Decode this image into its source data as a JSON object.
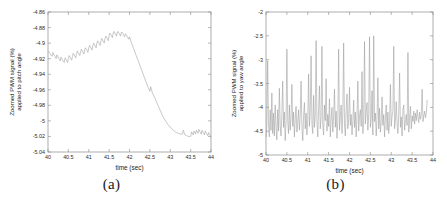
{
  "figure": {
    "background": "#ffffff",
    "line_color": "#9a9a9a",
    "axis_color": "#8a8a8a",
    "panels": [
      {
        "id": "a",
        "caption": "(a)"
      },
      {
        "id": "b",
        "caption": "(b)"
      }
    ]
  },
  "chart_data": [
    {
      "type": "line",
      "panel": "a",
      "caption": "(a)",
      "title": "",
      "xlabel": "time (sec)",
      "ylabel": "Zoomed PWM signal (%) applied to pitch angle",
      "ylabel_line1": "Zoomed PWM signal (%)",
      "ylabel_line2": "applied to pitch angle",
      "xlim": [
        40,
        44
      ],
      "ylim": [
        -5.04,
        -4.86
      ],
      "grid": false,
      "legend": "none",
      "xticks": [
        40,
        40.5,
        41,
        41.5,
        42,
        42.5,
        43,
        43.5,
        44
      ],
      "xticklabels": [
        "40",
        "40.5",
        "41",
        "41.5",
        "42",
        "42.5",
        "43",
        "43.5",
        "44"
      ],
      "yticks": [
        -5.04,
        -5.02,
        -5,
        -4.98,
        -4.96,
        -4.94,
        -4.92,
        -4.9,
        -4.88,
        -4.86
      ],
      "yticklabels": [
        "-5.04",
        "-5.02",
        "-5",
        "-4.98",
        "-4.96",
        "-4.94",
        "-4.92",
        "-4.9",
        "-4.88",
        "-4.86"
      ],
      "series": [
        {
          "name": "pitch PWM",
          "x": [
            40.0,
            40.02,
            40.04,
            40.06,
            40.08,
            40.1,
            40.12,
            40.14,
            40.16,
            40.18,
            40.2,
            40.22,
            40.24,
            40.26,
            40.28,
            40.3,
            40.32,
            40.34,
            40.36,
            40.38,
            40.4,
            40.42,
            40.44,
            40.46,
            40.48,
            40.5,
            40.52,
            40.54,
            40.56,
            40.58,
            40.6,
            40.62,
            40.64,
            40.66,
            40.68,
            40.7,
            40.72,
            40.74,
            40.76,
            40.78,
            40.8,
            40.82,
            40.84,
            40.86,
            40.88,
            40.9,
            40.92,
            40.94,
            40.96,
            40.98,
            41.0,
            41.02,
            41.04,
            41.06,
            41.08,
            41.1,
            41.12,
            41.14,
            41.16,
            41.18,
            41.2,
            41.22,
            41.24,
            41.26,
            41.28,
            41.3,
            41.32,
            41.34,
            41.36,
            41.38,
            41.4,
            41.42,
            41.44,
            41.46,
            41.48,
            41.5,
            41.52,
            41.54,
            41.56,
            41.58,
            41.6,
            41.62,
            41.64,
            41.66,
            41.68,
            41.7,
            41.72,
            41.74,
            41.76,
            41.78,
            41.8,
            41.82,
            41.84,
            41.86,
            41.88,
            41.9,
            41.92,
            41.94,
            41.96,
            41.98,
            42.0,
            42.05,
            42.1,
            42.15,
            42.2,
            42.25,
            42.3,
            42.35,
            42.4,
            42.45,
            42.5,
            42.52,
            42.54,
            42.56,
            42.6,
            42.65,
            42.7,
            42.75,
            42.8,
            42.85,
            42.9,
            42.95,
            43.0,
            43.05,
            43.1,
            43.15,
            43.2,
            43.25,
            43.3,
            43.32,
            43.34,
            43.36,
            43.4,
            43.45,
            43.5,
            43.52,
            43.54,
            43.56,
            43.58,
            43.6,
            43.62,
            43.64,
            43.66,
            43.68,
            43.7,
            43.72,
            43.74,
            43.76,
            43.78,
            43.8,
            43.82,
            43.84,
            43.86,
            43.88,
            43.9,
            43.92,
            43.94,
            43.96,
            43.98,
            44.0
          ],
          "y": [
            -4.91,
            -4.911,
            -4.913,
            -4.914,
            -4.916,
            -4.917,
            -4.912,
            -4.914,
            -4.916,
            -4.918,
            -4.92,
            -4.915,
            -4.917,
            -4.919,
            -4.921,
            -4.923,
            -4.918,
            -4.92,
            -4.922,
            -4.924,
            -4.925,
            -4.919,
            -4.921,
            -4.923,
            -4.925,
            -4.92,
            -4.916,
            -4.918,
            -4.92,
            -4.922,
            -4.917,
            -4.913,
            -4.915,
            -4.917,
            -4.919,
            -4.914,
            -4.91,
            -4.912,
            -4.914,
            -4.916,
            -4.911,
            -4.908,
            -4.91,
            -4.912,
            -4.914,
            -4.909,
            -4.906,
            -4.908,
            -4.91,
            -4.912,
            -4.906,
            -4.903,
            -4.905,
            -4.907,
            -4.909,
            -4.903,
            -4.9,
            -4.902,
            -4.904,
            -4.906,
            -4.9,
            -4.897,
            -4.899,
            -4.901,
            -4.903,
            -4.897,
            -4.894,
            -4.896,
            -4.898,
            -4.9,
            -4.894,
            -4.891,
            -4.893,
            -4.895,
            -4.897,
            -4.89,
            -4.887,
            -4.889,
            -4.891,
            -4.893,
            -4.887,
            -4.885,
            -4.887,
            -4.889,
            -4.891,
            -4.886,
            -4.885,
            -4.887,
            -4.889,
            -4.891,
            -4.886,
            -4.886,
            -4.888,
            -4.89,
            -4.892,
            -4.888,
            -4.889,
            -4.891,
            -4.893,
            -4.895,
            -4.892,
            -4.9,
            -4.907,
            -4.914,
            -4.921,
            -4.928,
            -4.935,
            -4.942,
            -4.949,
            -4.956,
            -4.962,
            -4.956,
            -4.96,
            -4.964,
            -4.968,
            -4.974,
            -4.98,
            -4.986,
            -4.992,
            -4.997,
            -5.001,
            -5.005,
            -5.008,
            -5.011,
            -5.013,
            -5.015,
            -5.016,
            -5.017,
            -5.017,
            -5.012,
            -5.015,
            -5.018,
            -5.019,
            -5.02,
            -5.02,
            -5.014,
            -5.016,
            -5.018,
            -5.013,
            -5.015,
            -5.017,
            -5.012,
            -5.014,
            -5.016,
            -5.011,
            -5.013,
            -5.015,
            -5.017,
            -5.012,
            -5.014,
            -5.016,
            -5.018,
            -5.013,
            -5.015,
            -5.017,
            -5.019,
            -5.015,
            -5.017,
            -5.019,
            -5.021,
            -5.022
          ]
        }
      ]
    },
    {
      "type": "line",
      "panel": "b",
      "caption": "(b)",
      "title": "",
      "xlabel": "time (sec)",
      "ylabel": "Zoomed PWM signal (%) applied to yaw angle",
      "ylabel_line1": "Zoomed PWM signal (%)",
      "ylabel_line2": "applied to yaw angle",
      "xlim": [
        40,
        44
      ],
      "ylim": [
        -5,
        -2
      ],
      "grid": false,
      "legend": "none",
      "xticks": [
        40,
        40.5,
        41,
        41.5,
        42,
        42.5,
        43,
        43.5,
        44
      ],
      "xticklabels": [
        "40",
        "40.5",
        "41",
        "41.5",
        "42",
        "42.5",
        "43",
        "43.5",
        "44"
      ],
      "yticks": [
        -5,
        -4.5,
        -4,
        -3.5,
        -3,
        -2.5,
        -2
      ],
      "yticklabels": [
        "-5",
        "-4.5",
        "-4",
        "-3.5",
        "-3",
        "-2.5",
        "-2"
      ],
      "series": [
        {
          "name": "yaw PWM",
          "x": [
            40.0,
            40.02,
            40.04,
            40.06,
            40.08,
            40.1,
            40.12,
            40.14,
            40.16,
            40.18,
            40.2,
            40.22,
            40.24,
            40.26,
            40.28,
            40.3,
            40.32,
            40.34,
            40.36,
            40.38,
            40.4,
            40.42,
            40.44,
            40.46,
            40.48,
            40.5,
            40.52,
            40.54,
            40.56,
            40.58,
            40.6,
            40.62,
            40.64,
            40.66,
            40.68,
            40.7,
            40.72,
            40.74,
            40.76,
            40.78,
            40.8,
            40.82,
            40.84,
            40.86,
            40.88,
            40.9,
            40.92,
            40.94,
            40.96,
            40.98,
            41.0,
            41.02,
            41.04,
            41.06,
            41.08,
            41.1,
            41.12,
            41.14,
            41.16,
            41.18,
            41.2,
            41.22,
            41.24,
            41.26,
            41.28,
            41.3,
            41.32,
            41.34,
            41.36,
            41.38,
            41.4,
            41.42,
            41.44,
            41.46,
            41.48,
            41.5,
            41.52,
            41.54,
            41.56,
            41.58,
            41.6,
            41.62,
            41.64,
            41.66,
            41.68,
            41.7,
            41.72,
            41.74,
            41.76,
            41.78,
            41.8,
            41.82,
            41.84,
            41.86,
            41.88,
            41.9,
            41.92,
            41.94,
            41.96,
            41.98,
            42.0,
            42.02,
            42.04,
            42.06,
            42.08,
            42.1,
            42.12,
            42.14,
            42.16,
            42.18,
            42.2,
            42.22,
            42.24,
            42.26,
            42.28,
            42.3,
            42.32,
            42.34,
            42.36,
            42.38,
            42.4,
            42.42,
            42.44,
            42.46,
            42.48,
            42.5,
            42.52,
            42.54,
            42.56,
            42.58,
            42.6,
            42.62,
            42.64,
            42.66,
            42.68,
            42.7,
            42.72,
            42.74,
            42.76,
            42.78,
            42.8,
            42.82,
            42.84,
            42.86,
            42.88,
            42.9,
            42.92,
            42.94,
            42.96,
            42.98,
            43.0,
            43.02,
            43.04,
            43.06,
            43.08,
            43.1,
            43.12,
            43.14,
            43.16,
            43.18,
            43.2,
            43.22,
            43.24,
            43.26,
            43.28,
            43.3,
            43.32,
            43.34,
            43.36,
            43.38,
            43.4,
            43.42,
            43.44,
            43.46,
            43.48,
            43.5,
            43.52,
            43.54,
            43.56,
            43.58,
            43.6,
            43.62,
            43.64,
            43.66,
            43.68,
            43.7,
            43.72,
            43.74,
            43.76,
            43.78,
            43.8,
            43.82,
            43.84,
            43.86,
            43.88,
            43.9,
            43.92,
            43.94,
            43.96,
            43.98,
            44.0
          ],
          "y": [
            -4.62,
            -4.4,
            -3.02,
            -4.35,
            -4.62,
            -4.05,
            -4.48,
            -3.7,
            -4.55,
            -4.12,
            -4.6,
            -3.95,
            -4.42,
            -4.68,
            -4.05,
            -4.5,
            -3.6,
            -4.38,
            -4.6,
            -4.15,
            -3.45,
            -4.42,
            -4.1,
            -4.7,
            -4.32,
            -2.78,
            -4.28,
            -4.55,
            -3.95,
            -4.48,
            -4.18,
            -3.52,
            -4.4,
            -4.1,
            -4.62,
            -4.25,
            -3.98,
            -4.52,
            -4.3,
            -4.05,
            -4.48,
            -4.15,
            -3.45,
            -4.38,
            -4.7,
            -4.2,
            -3.9,
            -4.45,
            -4.12,
            -4.58,
            -4.25,
            -3.3,
            -4.4,
            -4.08,
            -2.92,
            -4.35,
            -4.55,
            -3.75,
            -4.42,
            -4.18,
            -2.6,
            -4.3,
            -4.62,
            -4.05,
            -3.55,
            -4.45,
            -4.2,
            -2.72,
            -4.38,
            -4.58,
            -3.95,
            -4.28,
            -3.4,
            -4.5,
            -4.15,
            -4.4,
            -3.82,
            -4.62,
            -4.25,
            -4.0,
            -4.52,
            -4.18,
            -3.62,
            -4.42,
            -4.08,
            -4.65,
            -4.3,
            -2.78,
            -4.48,
            -4.2,
            -3.95,
            -4.55,
            -4.12,
            -2.65,
            -4.35,
            -4.6,
            -4.05,
            -3.72,
            -4.45,
            -4.25,
            -3.58,
            -4.38,
            -4.15,
            -4.58,
            -4.28,
            -3.85,
            -4.42,
            -4.1,
            -4.62,
            -4.2,
            -3.45,
            -4.5,
            -4.18,
            -4.05,
            -4.4,
            -3.25,
            -4.55,
            -4.22,
            -2.62,
            -4.35,
            -4.08,
            -3.9,
            -4.48,
            -4.15,
            -2.52,
            -4.42,
            -4.25,
            -3.65,
            -4.58,
            -2.5,
            -4.3,
            -4.12,
            -4.6,
            -4.2,
            -3.38,
            -4.45,
            -4.02,
            -4.52,
            -4.28,
            -3.78,
            -4.38,
            -4.15,
            -4.62,
            -4.22,
            -3.95,
            -4.48,
            -4.1,
            -4.55,
            -4.3,
            -3.52,
            -4.4,
            -4.18,
            -4.08,
            -2.72,
            -4.45,
            -4.25,
            -3.88,
            -4.35,
            -4.55,
            -4.12,
            -3.28,
            -4.42,
            -4.2,
            -4.6,
            -4.05,
            -3.95,
            -4.48,
            -4.28,
            -4.15,
            -4.38,
            -2.85,
            -4.52,
            -4.22,
            -3.98,
            -4.45,
            -4.18,
            -4.3,
            -4.08,
            -4.35,
            -4.12,
            -4.28,
            -4.05,
            -4.2,
            -4.32,
            -4.1,
            -4.25,
            -4.15,
            -3.62,
            -4.3,
            -4.18,
            -4.08,
            -4.22,
            -4.12,
            -3.85
          ]
        }
      ]
    }
  ]
}
